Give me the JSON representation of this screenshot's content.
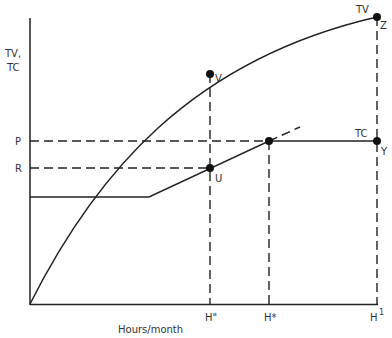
{
  "diagram": {
    "y_axis_label_line1": "TV,",
    "y_axis_label_line2": "TC",
    "x_axis_label": "Hours/month",
    "y_ticks": {
      "P": "P",
      "R": "R"
    },
    "x_ticks": {
      "h_double_prime": "H\"",
      "h_star": "H*",
      "h_one": "H",
      "h_one_sup": "1"
    },
    "curve_labels": {
      "tv": "TV",
      "tc": "TC"
    },
    "points": {
      "V": "V",
      "U": "U",
      "Z": "Z",
      "Y": "Y"
    },
    "colors": {
      "ink": "#222222",
      "background": "#ffffff"
    }
  }
}
